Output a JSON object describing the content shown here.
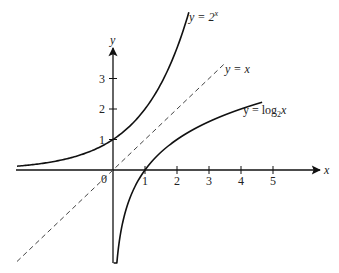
{
  "chart_data": {
    "type": "line",
    "title": "",
    "xlabel": "x",
    "ylabel": "y",
    "origin_label": "0",
    "x_ticks": [
      1,
      2,
      3,
      4,
      5
    ],
    "y_ticks": [
      1,
      2,
      3
    ],
    "xlim": [
      -3,
      6
    ],
    "ylim": [
      -3,
      5
    ],
    "grid": false,
    "legend": "inline labels",
    "series": [
      {
        "name": "y = 2^x",
        "label_main": "y = 2",
        "label_sup": "x",
        "style": "solid",
        "function": "2^x",
        "x_range": [
          -3,
          2.37
        ]
      },
      {
        "name": "y = x",
        "label_main": "y = x",
        "style": "dashed",
        "function": "x",
        "x_range": [
          -3,
          3.5
        ]
      },
      {
        "name": "y = log2 x",
        "label_main": "y = log",
        "label_sub": "2",
        "label_tail": "x",
        "style": "solid",
        "function": "log2(x)",
        "x_range": [
          0.02,
          4.66
        ]
      }
    ],
    "colors": {
      "axis": "#111111",
      "curve": "#111111",
      "dashed": "#444444",
      "background": "#ffffff"
    }
  }
}
